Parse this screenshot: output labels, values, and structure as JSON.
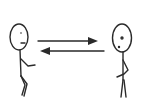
{
  "diagram": {
    "type": "stick-figure-interaction",
    "stroke_color": "#2a2a2a",
    "background_color": "#ffffff",
    "figures": [
      {
        "id": "left-person",
        "position": "left"
      },
      {
        "id": "right-person",
        "position": "right"
      }
    ],
    "arrows": [
      {
        "id": "arrow-left-to-right",
        "direction": "right",
        "from": "left-person",
        "to": "right-person"
      },
      {
        "id": "arrow-right-to-left",
        "direction": "left",
        "from": "right-person",
        "to": "left-person"
      }
    ]
  }
}
